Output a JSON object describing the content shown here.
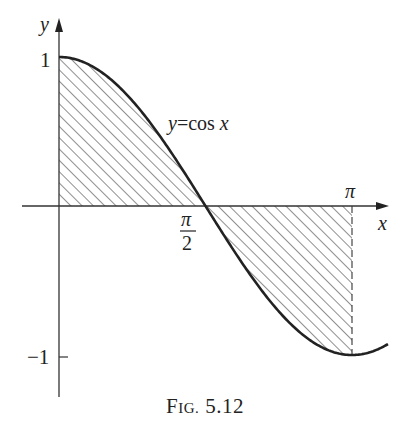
{
  "figure": {
    "caption_prefix_F": "F",
    "caption_prefix_rest": "IG.",
    "caption_number": "5.12",
    "curve_label": "y=cos x",
    "axis_labels": {
      "x": "x",
      "y": "y"
    },
    "ticks": {
      "y_top": "1",
      "y_bottom": "−1",
      "x_half_pi_num": "π",
      "x_half_pi_den": "2",
      "x_pi": "π"
    },
    "colors": {
      "ink": "#222222",
      "background": "#ffffff"
    }
  },
  "chart_data": {
    "type": "line",
    "title": "Fig. 5.12",
    "function": "y = cos x",
    "xlabel": "x",
    "ylabel": "y",
    "x_ticks": [
      "π/2",
      "π"
    ],
    "y_ticks": [
      "1",
      "−1"
    ],
    "xlim": [
      0,
      3.5
    ],
    "ylim": [
      -1,
      1
    ],
    "series": [
      {
        "name": "y = cos x",
        "x": [
          0,
          0.3927,
          0.7854,
          1.1781,
          1.5708,
          1.9635,
          2.3562,
          2.7489,
          3.1416,
          3.5
        ],
        "values": [
          1,
          0.924,
          0.707,
          0.383,
          0,
          -0.383,
          -0.707,
          -0.924,
          -1,
          -0.936
        ]
      }
    ],
    "shaded_region": {
      "from": 0,
      "to": "π",
      "between": "curve and x-axis",
      "style": "diagonal hatching"
    },
    "annotations": [
      "dashed vertical line at x = π",
      "label y=cos x near curve"
    ],
    "grid": false
  }
}
